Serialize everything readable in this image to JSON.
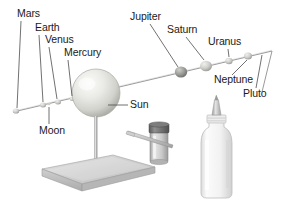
{
  "figure": {
    "type": "instructional-diagram",
    "background_color": "#ffffff",
    "label_color": "#1a1a1a",
    "wire_color": "#8a8a8a",
    "leader_color": "#4d4d4d"
  },
  "labels": {
    "mars": "Mars",
    "earth": "Earth",
    "venus": "Venus",
    "mercury": "Mercury",
    "moon": "Moon",
    "sun": "Sun",
    "jupiter": "Jupiter",
    "saturn": "Saturn",
    "uranus": "Uranus",
    "neptune": "Neptune",
    "pluto": "Pluto"
  },
  "parts": {
    "sun_sphere": "sun-sphere",
    "support_rod": "support-rod",
    "base_plate": "base-plate",
    "planet_wire": "planet-wire",
    "paint_jar": "paint-jar",
    "brush": "brush",
    "glue_bottle": "glue-bottle"
  },
  "colors": {
    "sphere_light": "#f2f2f0",
    "sphere_mid": "#d8d8d4",
    "sphere_dark": "#b4b4b0",
    "base_top": "#d2d2d2",
    "base_front": "#bfbfbf",
    "base_side": "#a8a8a8",
    "jar_lid": "#6e6e6e",
    "jar_body": "#d9d9d9",
    "bottle_body": "#f4f4f4",
    "bottle_edge": "#c8c8c8",
    "jupiter_bead": "#8e8e8e",
    "saturn_bead": "#a9a9a9",
    "uranus_bead": "#cfcfcf",
    "neptune_bead": "#c4c4c4"
  }
}
